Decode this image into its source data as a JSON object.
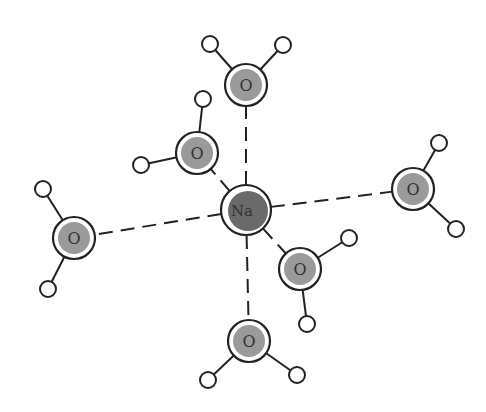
{
  "diagram": {
    "center_ion": {
      "label": "Na",
      "x": 246,
      "y": 210,
      "r": 25,
      "fill": "#6a6a6a"
    },
    "oxygen_radius": 21,
    "hydrogen_radius": 8,
    "colors": {
      "stroke": "#222222",
      "oxygen_fill": "#9a9a9a",
      "na_fill": "#6a6a6a",
      "bond_dash": "#222222"
    },
    "waters": [
      {
        "label": "O",
        "name": "water-top",
        "x": 246,
        "y": 85,
        "h": [
          [
            210,
            44
          ],
          [
            283,
            45
          ]
        ]
      },
      {
        "label": "O",
        "name": "water-upper-left",
        "x": 197,
        "y": 153,
        "h": [
          [
            203,
            99
          ],
          [
            141,
            165
          ]
        ]
      },
      {
        "label": "O",
        "name": "water-right",
        "x": 413,
        "y": 189,
        "h": [
          [
            439,
            143
          ],
          [
            456,
            229
          ]
        ]
      },
      {
        "label": "O",
        "name": "water-left",
        "x": 74,
        "y": 238,
        "h": [
          [
            43,
            189
          ],
          [
            48,
            289
          ]
        ]
      },
      {
        "label": "O",
        "name": "water-lower-right",
        "x": 300,
        "y": 269,
        "h": [
          [
            349,
            238
          ],
          [
            307,
            324
          ]
        ]
      },
      {
        "label": "O",
        "name": "water-bottom",
        "x": 249,
        "y": 341,
        "h": [
          [
            208,
            380
          ],
          [
            297,
            375
          ]
        ]
      }
    ]
  }
}
